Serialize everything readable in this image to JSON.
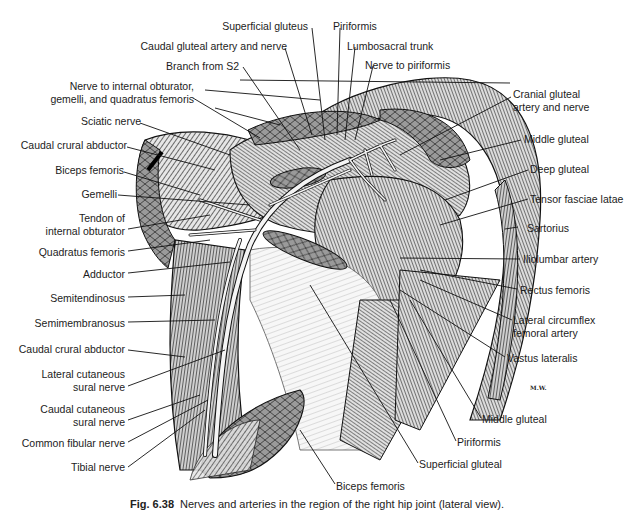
{
  "figure": {
    "type": "anatomical-illustration",
    "caption": {
      "number": "Fig. 6.38",
      "text": "Nerves and arteries in the region of the right hip joint (lateral view)."
    },
    "signature": "M.W."
  },
  "labels": {
    "left": [
      {
        "id": "nerve-internal-obturator",
        "lines": [
          "Nerve to internal obturator,",
          "gemelli, and quadratus femoris"
        ]
      },
      {
        "id": "sciatic-nerve",
        "lines": [
          "Sciatic nerve"
        ]
      },
      {
        "id": "caudal-crural-abductor-1",
        "lines": [
          "Caudal crural abductor"
        ]
      },
      {
        "id": "biceps-femoris-1",
        "lines": [
          "Biceps femoris"
        ]
      },
      {
        "id": "gemelli",
        "lines": [
          "Gemelli"
        ]
      },
      {
        "id": "tendon-internal-obturator",
        "lines": [
          "Tendon of",
          "internal obturator"
        ]
      },
      {
        "id": "quadratus-femoris",
        "lines": [
          "Quadratus femoris"
        ]
      },
      {
        "id": "adductor",
        "lines": [
          "Adductor"
        ]
      },
      {
        "id": "semitendinosus",
        "lines": [
          "Semitendinosus"
        ]
      },
      {
        "id": "semimembranosus",
        "lines": [
          "Semimembranosus"
        ]
      },
      {
        "id": "caudal-crural-abductor-2",
        "lines": [
          "Caudal crural abductor"
        ]
      },
      {
        "id": "lateral-cutaneous-sural-nerve",
        "lines": [
          "Lateral cutaneous",
          "sural nerve"
        ]
      },
      {
        "id": "caudal-cutaneous-sural-nerve",
        "lines": [
          "Caudal cutaneous",
          "sural nerve"
        ]
      },
      {
        "id": "common-fibular-nerve",
        "lines": [
          "Common fibular nerve"
        ]
      },
      {
        "id": "tibial-nerve",
        "lines": [
          "Tibial nerve"
        ]
      }
    ],
    "top": [
      {
        "id": "superficial-gluteus",
        "lines": [
          "Superficial gluteus"
        ]
      },
      {
        "id": "caudal-gluteal-artery-nerve",
        "lines": [
          "Caudal gluteal artery and nerve"
        ]
      },
      {
        "id": "branch-from-s2",
        "lines": [
          "Branch from S2"
        ]
      },
      {
        "id": "piriformis-top",
        "lines": [
          "Piriformis"
        ]
      },
      {
        "id": "lumbosacral-trunk",
        "lines": [
          "Lumbosacral trunk"
        ]
      },
      {
        "id": "nerve-to-piriformis",
        "lines": [
          "Nerve to piriformis"
        ]
      }
    ],
    "right": [
      {
        "id": "cranial-gluteal-artery-nerve",
        "lines": [
          "Cranial gluteal",
          "artery and nerve"
        ]
      },
      {
        "id": "middle-gluteal-1",
        "lines": [
          "Middle gluteal"
        ]
      },
      {
        "id": "deep-gluteal",
        "lines": [
          "Deep gluteal"
        ]
      },
      {
        "id": "tensor-fasciae-latae",
        "lines": [
          "Tensor fasciae latae"
        ]
      },
      {
        "id": "sartorius",
        "lines": [
          "Sartorius"
        ]
      },
      {
        "id": "iliolumbar-artery",
        "lines": [
          "Iliolumbar artery"
        ]
      },
      {
        "id": "rectus-femoris",
        "lines": [
          "Rectus femoris"
        ]
      },
      {
        "id": "lateral-circumflex-femoral-artery",
        "lines": [
          "Lateral circumflex",
          "femoral artery"
        ]
      },
      {
        "id": "vastus-lateralis",
        "lines": [
          "Vastus lateralis"
        ]
      }
    ],
    "bottom": [
      {
        "id": "middle-gluteal-2",
        "lines": [
          "Middle gluteal"
        ]
      },
      {
        "id": "piriformis-bottom",
        "lines": [
          "Piriformis"
        ]
      },
      {
        "id": "superficial-gluteal",
        "lines": [
          "Superficial gluteal"
        ]
      },
      {
        "id": "biceps-femoris-2",
        "lines": [
          "Biceps femoris"
        ]
      }
    ]
  },
  "colors": {
    "ink": "#1c1c1c",
    "background": "#ffffff",
    "muscle_dark": "#3a3a3a",
    "muscle_mid": "#8a8a8a",
    "muscle_light": "#d8d8d8",
    "nerve": "#f4f4f4"
  }
}
